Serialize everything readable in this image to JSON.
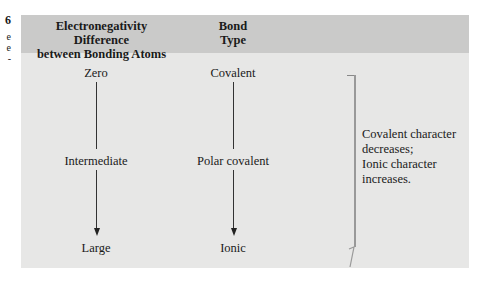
{
  "edge_caption": {
    "number_fragment": "6",
    "line_fragments": [
      "e",
      "e",
      "-"
    ]
  },
  "table": {
    "headers": {
      "left": [
        "Electronegativity Difference",
        "between Bonding Atoms"
      ],
      "middle": [
        "Bond",
        "Type"
      ]
    },
    "rows": [
      {
        "difference": "Zero",
        "bond_type": "Covalent"
      },
      {
        "difference": "Intermediate",
        "bond_type": "Polar covalent"
      },
      {
        "difference": "Large",
        "bond_type": "Ionic"
      }
    ],
    "note": [
      "Covalent character",
      "decreases;",
      "Ionic character",
      "increases."
    ]
  },
  "colors": {
    "header_bg": "#cacac9",
    "body_bg": "#e7e7e6",
    "arrow": "#222222"
  }
}
